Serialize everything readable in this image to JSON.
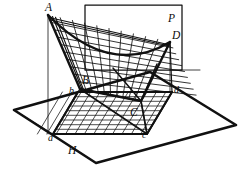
{
  "figure": {
    "type": "geometry-diagram",
    "stroke_color": "#111111",
    "background_color": "#ffffff"
  },
  "labels": {
    "A": "A",
    "B": "B",
    "C": "C",
    "D": "D",
    "P": "P",
    "H": "H",
    "a": "a",
    "b": "b",
    "c": "c",
    "d": "d"
  },
  "label_positions": {
    "A": {
      "x": 45,
      "y": 2
    },
    "P": {
      "x": 168,
      "y": 13
    },
    "D": {
      "x": 172,
      "y": 30
    },
    "B": {
      "x": 82,
      "y": 75
    },
    "b": {
      "x": 69,
      "y": 86
    },
    "d": {
      "x": 174,
      "y": 85
    },
    "C": {
      "x": 130,
      "y": 107
    },
    "c": {
      "x": 142,
      "y": 130
    },
    "a": {
      "x": 48,
      "y": 133
    },
    "H": {
      "x": 68,
      "y": 145
    }
  },
  "geometry": {
    "plane_H": {
      "name": "horizontal-plane",
      "vertices": [
        [
          14,
          110
        ],
        [
          96,
          163
        ],
        [
          236,
          125
        ],
        [
          150,
          72
        ]
      ]
    },
    "plane_P": {
      "name": "vertical-plane-rectangle",
      "vertices": [
        [
          85,
          5
        ],
        [
          182,
          5
        ],
        [
          182,
          70
        ],
        [
          85,
          70
        ]
      ]
    },
    "saddle_corners": {
      "A": [
        48,
        15
      ],
      "B": [
        80,
        89
      ],
      "C": [
        141,
        101
      ],
      "D": [
        170,
        42
      ]
    },
    "base_quad_abcd": {
      "a": [
        53,
        134
      ],
      "b": [
        78,
        92
      ],
      "c": [
        147,
        134
      ],
      "d": [
        172,
        92
      ]
    },
    "vertical_edges": [
      {
        "from": "A",
        "to": "a"
      },
      {
        "from": "B",
        "to": "b"
      },
      {
        "from": "C",
        "to": "c"
      },
      {
        "from": "D",
        "to": "d"
      }
    ],
    "grid_divisions": {
      "u": 10,
      "v": 9
    }
  }
}
